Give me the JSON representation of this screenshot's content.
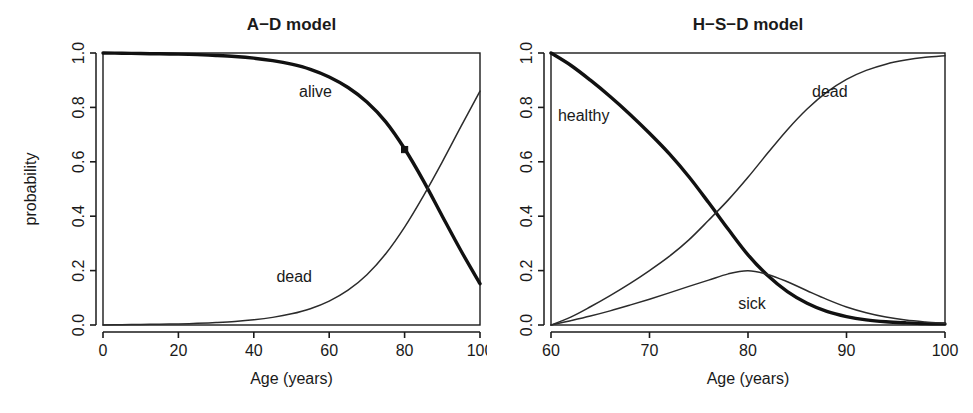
{
  "figure": {
    "background": "#ffffff",
    "ink_color": "#111111",
    "panel_count": 2
  },
  "chart_data": [
    {
      "type": "line",
      "id": "a-d-model",
      "title": "A−D model",
      "xlabel": "Age (years)",
      "ylabel": "probability",
      "xlim": [
        0,
        100
      ],
      "ylim": [
        0.0,
        1.0
      ],
      "grid": false,
      "legend_position": "inline-annotations",
      "xticks": [
        0,
        20,
        40,
        60,
        80,
        100
      ],
      "xticklabels": [
        "0",
        "20",
        "40",
        "60",
        "80",
        "100"
      ],
      "yticks": [
        0.0,
        0.2,
        0.4,
        0.6,
        0.8,
        1.0
      ],
      "yticklabels": [
        "0.0",
        "0.2",
        "0.4",
        "0.6",
        "0.8",
        "1.0"
      ],
      "annotations": [
        {
          "text": "alive",
          "x": 52,
          "y": 0.855
        },
        {
          "text": "dead",
          "x": 46,
          "y": 0.175
        }
      ],
      "markers": [
        {
          "x": 80,
          "y": 0.645,
          "shape": "square",
          "series": "alive"
        }
      ],
      "x": [
        0,
        5,
        10,
        15,
        20,
        25,
        30,
        35,
        40,
        45,
        50,
        55,
        60,
        65,
        70,
        75,
        80,
        85,
        90,
        95,
        100
      ],
      "series": [
        {
          "name": "alive",
          "style": "thick",
          "values": [
            1.0,
            0.999,
            0.998,
            0.997,
            0.996,
            0.994,
            0.991,
            0.987,
            0.981,
            0.972,
            0.959,
            0.94,
            0.912,
            0.873,
            0.82,
            0.747,
            0.648,
            0.53,
            0.4,
            0.272,
            0.152
          ]
        },
        {
          "name": "dead",
          "style": "thin",
          "values": [
            0.0,
            0.001,
            0.002,
            0.003,
            0.004,
            0.006,
            0.009,
            0.013,
            0.019,
            0.028,
            0.041,
            0.06,
            0.088,
            0.128,
            0.185,
            0.262,
            0.36,
            0.475,
            0.6,
            0.731,
            0.86
          ]
        }
      ]
    },
    {
      "type": "line",
      "id": "h-s-d-model",
      "title": "H−S−D model",
      "xlabel": "Age (years)",
      "ylabel": "",
      "xlim": [
        60,
        100
      ],
      "ylim": [
        0.0,
        1.0
      ],
      "grid": false,
      "legend_position": "inline-annotations",
      "xticks": [
        60,
        70,
        80,
        90,
        100
      ],
      "xticklabels": [
        "60",
        "70",
        "80",
        "90",
        "100"
      ],
      "yticks": [
        0.0,
        0.2,
        0.4,
        0.6,
        0.8,
        1.0
      ],
      "yticklabels": [
        "0.0",
        "0.2",
        "0.4",
        "0.6",
        "0.8",
        "1.0"
      ],
      "annotations": [
        {
          "text": "healthy",
          "x": 60.7,
          "y": 0.765
        },
        {
          "text": "dead",
          "x": 86.5,
          "y": 0.855
        },
        {
          "text": "sick",
          "x": 79.0,
          "y": 0.075
        }
      ],
      "markers": [],
      "x": [
        60,
        62,
        64,
        66,
        68,
        70,
        72,
        74,
        76,
        78,
        80,
        82,
        84,
        86,
        88,
        90,
        92,
        94,
        96,
        98,
        100
      ],
      "series": [
        {
          "name": "healthy",
          "style": "thick",
          "values": [
            1.0,
            0.955,
            0.9,
            0.84,
            0.775,
            0.705,
            0.63,
            0.545,
            0.45,
            0.352,
            0.258,
            0.182,
            0.123,
            0.08,
            0.05,
            0.031,
            0.019,
            0.012,
            0.008,
            0.005,
            0.004
          ]
        },
        {
          "name": "sick",
          "style": "thin",
          "values": [
            0.0,
            0.016,
            0.033,
            0.052,
            0.073,
            0.095,
            0.118,
            0.142,
            0.165,
            0.188,
            0.199,
            0.186,
            0.159,
            0.126,
            0.094,
            0.066,
            0.045,
            0.029,
            0.018,
            0.011,
            0.006
          ]
        },
        {
          "name": "dead",
          "style": "thin",
          "values": [
            0.0,
            0.029,
            0.067,
            0.108,
            0.152,
            0.2,
            0.252,
            0.313,
            0.385,
            0.46,
            0.543,
            0.632,
            0.718,
            0.794,
            0.856,
            0.903,
            0.936,
            0.959,
            0.974,
            0.984,
            0.99
          ]
        }
      ]
    }
  ]
}
